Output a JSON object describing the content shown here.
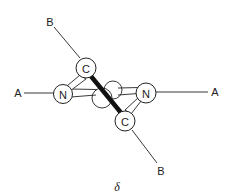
{
  "diagram": {
    "caption": "δ",
    "atoms": {
      "c_top": {
        "label": "C"
      },
      "c_bottom": {
        "label": "C"
      },
      "n_left": {
        "label": "N"
      },
      "n_right": {
        "label": "N"
      }
    },
    "substituents": {
      "b_top": {
        "label": "B"
      },
      "b_bottom": {
        "label": "B"
      },
      "a_left": {
        "label": "A"
      },
      "a_right": {
        "label": "A"
      }
    },
    "colors": {
      "stroke": "#222222",
      "background": "#ffffff"
    }
  }
}
